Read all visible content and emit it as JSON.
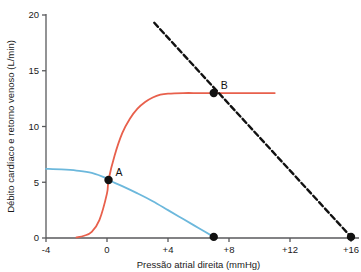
{
  "chart_data": {
    "type": "line",
    "title": "",
    "xlabel": "Pressão atrial direita (mmHg)",
    "ylabel": "Débito cardíaco e retorno venoso (L/min)",
    "xlim": [
      -4,
      16
    ],
    "ylim": [
      0,
      20
    ],
    "grid": false,
    "legend": "none",
    "xticks": [
      "-4",
      "0",
      "+4",
      "+8",
      "+12",
      "+16"
    ],
    "xtick_values": [
      -4,
      0,
      4,
      8,
      12,
      16
    ],
    "yticks": [
      "0",
      "5",
      "10",
      "15",
      "20"
    ],
    "ytick_values": [
      0,
      5,
      10,
      15,
      20
    ],
    "series": [
      {
        "name": "venous-return-curve",
        "style": "solid",
        "color": "#6cb8dc",
        "x": [
          -4.0,
          -3.0,
          -2.0,
          -1.0,
          0.0,
          0.1,
          1.0,
          2.0,
          3.0,
          4.0,
          5.0,
          6.0,
          7.0
        ],
        "y": [
          6.2,
          6.15,
          6.05,
          5.85,
          5.35,
          5.2,
          4.65,
          4.0,
          3.3,
          2.5,
          1.7,
          0.9,
          0.1
        ]
      },
      {
        "name": "cardiac-output-curve",
        "style": "solid",
        "color": "#e8604c",
        "x": [
          -2.0,
          -1.5,
          -1.0,
          -0.5,
          0.0,
          0.1,
          0.5,
          1.0,
          1.5,
          2.0,
          2.5,
          3.0,
          3.5,
          4.0,
          5.0,
          6.0,
          7.0,
          8.0,
          9.0,
          10.0,
          11.0
        ],
        "y": [
          0.05,
          0.2,
          0.55,
          1.6,
          4.0,
          5.2,
          7.4,
          9.4,
          10.7,
          11.6,
          12.2,
          12.6,
          12.85,
          12.95,
          13.0,
          13.0,
          13.0,
          13.0,
          13.0,
          13.0,
          13.0
        ]
      },
      {
        "name": "dashed-line",
        "style": "dashed",
        "color": "#111111",
        "x": [
          3.1,
          16.0
        ],
        "y": [
          19.3,
          0.1
        ]
      }
    ],
    "annotations": [
      {
        "name": "point-a",
        "label": "A",
        "x": 0.1,
        "y": 5.2,
        "marker": "filled-circle"
      },
      {
        "name": "point-b",
        "label": "B",
        "x": 7.0,
        "y": 13.0,
        "marker": "filled-circle"
      },
      {
        "name": "venous-return-x-intercept",
        "label": "",
        "x": 7.0,
        "y": 0.1,
        "marker": "filled-circle"
      },
      {
        "name": "dashed-line-x-intercept",
        "label": "",
        "x": 16.0,
        "y": 0.1,
        "marker": "filled-circle"
      }
    ],
    "colors": {
      "venous_return": "#6cb8dc",
      "cardiac_output": "#e8604c",
      "dashed_line": "#111111",
      "axis": "#58595b",
      "text": "#1a1a1a",
      "background": "#ffffff"
    }
  }
}
